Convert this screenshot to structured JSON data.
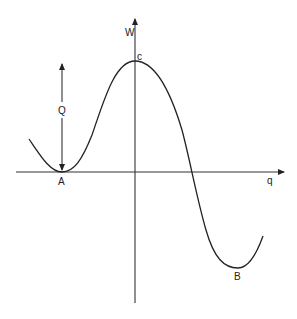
{
  "diagram": {
    "type": "potential-energy-curve",
    "axes": {
      "x_label": "q",
      "y_label": "W"
    },
    "points": {
      "A": {
        "label": "A",
        "description": "local minimum on q axis"
      },
      "B": {
        "label": "B",
        "description": "global minimum below q axis"
      },
      "C": {
        "label": "c",
        "description": "maximum on W axis"
      }
    },
    "barrier": {
      "label": "Q",
      "description": "double-headed arrow from A up to level of c"
    },
    "colors": {
      "line": "#222222",
      "background": "#ffffff"
    }
  }
}
